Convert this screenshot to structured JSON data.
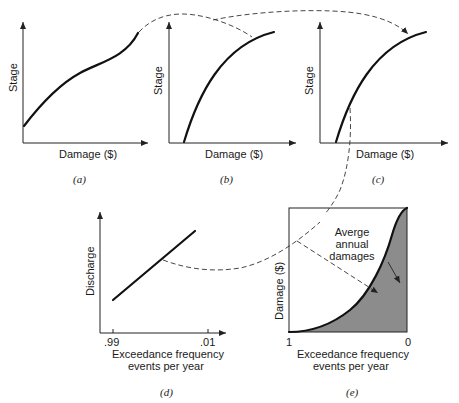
{
  "panels": {
    "a": {
      "caption": "(a)",
      "ylabel": "Stage",
      "xlabel": "Damage ($)"
    },
    "b": {
      "caption": "(b)",
      "ylabel": "Stage",
      "xlabel": "Damage ($)"
    },
    "c": {
      "caption": "(c)",
      "ylabel": "Stage",
      "xlabel": "Damage ($)"
    },
    "d": {
      "caption": "(d)",
      "ylabel": "Discharge",
      "xlabel_line1": "Exceedance frequency",
      "xlabel_line2": "events per year",
      "tick_left": ".99",
      "tick_right": ".01"
    },
    "e": {
      "caption": "(e)",
      "ylabel": "Damage ($)",
      "xlabel_line1": "Exceedance frequency",
      "xlabel_line2": "events per year",
      "tick_left": "1",
      "tick_right": "0",
      "annotation_line1": "Averge",
      "annotation_line2": "annual",
      "annotation_line3": "damages"
    }
  },
  "colors": {
    "shade": "#8c8c8c",
    "line": "#111111"
  }
}
